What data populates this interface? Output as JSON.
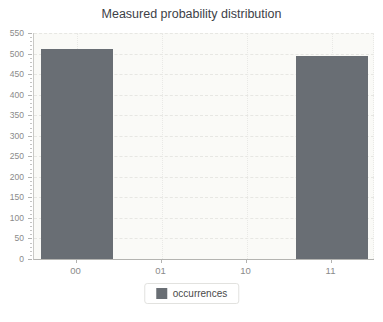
{
  "chart_data": {
    "type": "bar",
    "title": "Measured probability distribution",
    "categories": [
      "00",
      "01",
      "10",
      "11"
    ],
    "series": [
      {
        "name": "occurrences",
        "values": [
          510,
          0,
          0,
          495
        ]
      }
    ],
    "xlabel": "",
    "ylabel": "",
    "ylim": [
      0,
      550
    ],
    "yticks": [
      0,
      50,
      100,
      150,
      200,
      250,
      300,
      350,
      400,
      450,
      500,
      550
    ],
    "y_minor_step": 10,
    "grid": true,
    "legend_position": "bottom",
    "colors": {
      "bar": "#696e74",
      "plot_bg": "#fafaf7",
      "grid_h": "#e7e7e3",
      "grid_v": "#e9e9e6",
      "axis_line": "#c9c9c6",
      "tick_label": "#8a8a8a",
      "title_text": "#3d4147",
      "legend_border": "#e2e2df",
      "legend_text": "#4a4a4a"
    }
  }
}
